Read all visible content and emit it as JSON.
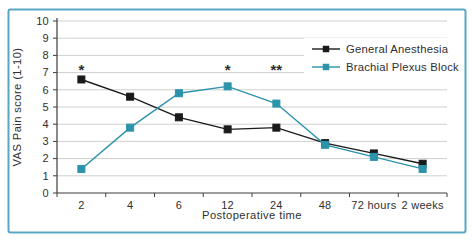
{
  "figure": {
    "border_color": "#58a7c2",
    "background": "#ffffff",
    "grid_color": "#cdd1ce",
    "axis_color": "#3c3c3c",
    "text_color": "#2f2f2f",
    "annotation_color": "#84a7bd"
  },
  "chart_data": {
    "type": "line",
    "title": "",
    "xlabel": "Postoperative time",
    "ylabel": "VAS Pain score (1-10)",
    "categories": [
      "2",
      "4",
      "6",
      "12",
      "24",
      "48",
      "72 hours",
      "2 weeks"
    ],
    "ylim": [
      0,
      10
    ],
    "yticks": [
      0,
      1,
      2,
      3,
      4,
      5,
      6,
      7,
      8,
      9,
      10
    ],
    "grid": "horizontal",
    "legend_position": "top-right",
    "series": [
      {
        "name": "General Anesthesia",
        "color": "#1a1a1a",
        "marker": "square",
        "values": [
          6.6,
          5.6,
          4.4,
          3.7,
          3.8,
          2.9,
          2.3,
          1.7
        ]
      },
      {
        "name": "Brachial Plexus Block",
        "color": "#2b93aa",
        "marker": "square",
        "values": [
          1.4,
          3.8,
          5.8,
          6.2,
          5.2,
          2.8,
          2.1,
          1.4
        ]
      }
    ],
    "annotations": [
      {
        "text": "*",
        "category_index": 0,
        "value": 7.35
      },
      {
        "text": "*",
        "category_index": 3,
        "value": 7.35
      },
      {
        "text": "**",
        "category_index": 4,
        "value": 7.35
      }
    ]
  }
}
